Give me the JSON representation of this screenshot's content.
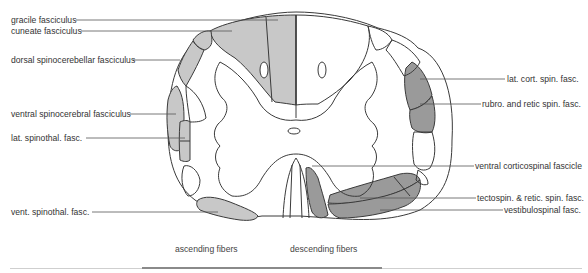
{
  "figure": {
    "colors": {
      "ascending_fill": "#c8c8c8",
      "descending_fill": "#9a9a9a",
      "outline": "#3a3a3a",
      "leader": "#555555",
      "background": "#ffffff"
    }
  },
  "labels_left": [
    {
      "text": "gracile fasciculus"
    },
    {
      "text": "cuneate fasciculus"
    },
    {
      "text": "dorsal spinocerebellar fasciculus"
    },
    {
      "text": "ventral spinocerebral fasciculus"
    },
    {
      "text": "lat. spinothal. fasc."
    },
    {
      "text": "vent. spinothal. fasc."
    }
  ],
  "labels_right": [
    {
      "text": "lat. cort. spin. fasc."
    },
    {
      "text": "rubro. and retic spin. fasc."
    },
    {
      "text": "ventral corticospinal fascicle"
    },
    {
      "text": "tectospin. & retic. spin. fasc."
    },
    {
      "text": "vestibulospinal fasc."
    }
  ],
  "captions": {
    "left": "ascending fibers",
    "right": "descending fibers"
  }
}
